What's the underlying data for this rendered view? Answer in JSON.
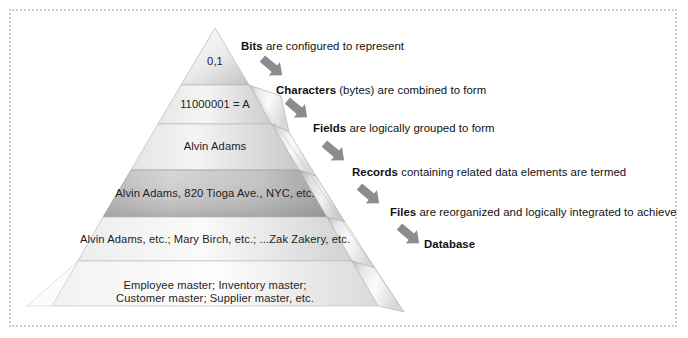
{
  "figure": {
    "frame": {
      "style": "dotted",
      "color": "#c9c9cf"
    },
    "background": "#ffffff"
  },
  "pyramid": {
    "name": "data-hierarchy-pyramid",
    "levels": [
      {
        "id": "bits",
        "text": "0,1"
      },
      {
        "id": "characters",
        "text": "11000001 = A"
      },
      {
        "id": "fields",
        "text": "Alvin Adams"
      },
      {
        "id": "records",
        "text": "Alvin Adams, 820 Tioga Ave., NYC, etc."
      },
      {
        "id": "files",
        "text": "Alvin Adams, etc.; Mary Birch, etc.; ...Zak Zakery, etc."
      },
      {
        "id": "database",
        "line1": "Employee master; Inventory master;",
        "line2": "Customer master; Supplier master, etc."
      }
    ]
  },
  "steps": [
    {
      "id": "bits",
      "term": "Bits",
      "rest": " are configured to represent"
    },
    {
      "id": "characters",
      "term": "Characters",
      "rest": " (bytes) are combined to form"
    },
    {
      "id": "fields",
      "term": "Fields",
      "rest": " are logically grouped to form"
    },
    {
      "id": "records",
      "term": "Records",
      "rest": " containing related data elements are termed"
    },
    {
      "id": "files",
      "term": "Files",
      "rest": " are reorganized and logically integrated to achieve"
    },
    {
      "id": "database",
      "term": "Database",
      "rest": ""
    }
  ],
  "arrows": {
    "count": 5,
    "direction": "down-right",
    "color": "#8c8c8c"
  },
  "colors": {
    "text": "#1d1d1d",
    "frame": "#c9c9cf",
    "pyramid_light": "#f4f4f4",
    "pyramid_mid": "#dcdcdc",
    "pyramid_dark": "#9a9a9a",
    "arrow": "#8c8c8c"
  }
}
